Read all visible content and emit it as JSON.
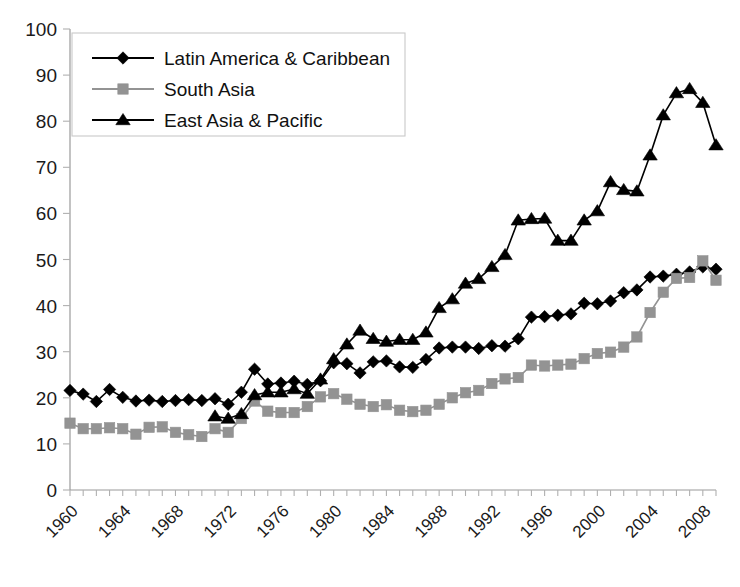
{
  "chart_data": {
    "type": "line",
    "title": "",
    "subtitle": "",
    "xlabel": "",
    "ylabel": "",
    "ylim": [
      0,
      100
    ],
    "ytick_step": 10,
    "yticks": [
      0,
      10,
      20,
      30,
      40,
      50,
      60,
      70,
      80,
      90,
      100
    ],
    "xlim": [
      1960,
      2009
    ],
    "xtick_labels": [
      "1960",
      "1964",
      "1968",
      "1972",
      "1976",
      "1980",
      "1984",
      "1988",
      "1992",
      "1996",
      "2000",
      "2004",
      "2008"
    ],
    "xtick_years": [
      1960,
      1964,
      1968,
      1972,
      1976,
      1980,
      1984,
      1988,
      1992,
      1996,
      2000,
      2004,
      2008
    ],
    "x_minor_tick_interval": 1,
    "grid": false,
    "legend_position": "top-left",
    "x": [
      1960,
      1961,
      1962,
      1963,
      1964,
      1965,
      1966,
      1967,
      1968,
      1969,
      1970,
      1971,
      1972,
      1973,
      1974,
      1975,
      1976,
      1977,
      1978,
      1979,
      1980,
      1981,
      1982,
      1983,
      1984,
      1985,
      1986,
      1987,
      1988,
      1989,
      1990,
      1991,
      1992,
      1993,
      1994,
      1995,
      1996,
      1997,
      1998,
      1999,
      2000,
      2001,
      2002,
      2003,
      2004,
      2005,
      2006,
      2007,
      2008,
      2009
    ],
    "series": [
      {
        "name": "Latin America & Caribbean",
        "color": "#000000",
        "marker": "diamond",
        "x": [
          1960,
          1961,
          1962,
          1963,
          1964,
          1965,
          1966,
          1967,
          1968,
          1969,
          1970,
          1971,
          1972,
          1973,
          1974,
          1975,
          1976,
          1977,
          1978,
          1979,
          1980,
          1981,
          1982,
          1983,
          1984,
          1985,
          1986,
          1987,
          1988,
          1989,
          1990,
          1991,
          1992,
          1993,
          1994,
          1995,
          1996,
          1997,
          1998,
          1999,
          2000,
          2001,
          2002,
          2003,
          2004,
          2005,
          2006,
          2007,
          2008,
          2009
        ],
        "values": [
          21.6,
          20.8,
          19.2,
          21.8,
          20.1,
          19.3,
          19.5,
          19.2,
          19.4,
          19.6,
          19.4,
          19.8,
          18.6,
          21.2,
          26.2,
          23.0,
          23.2,
          23.6,
          22.9,
          23.7,
          27.6,
          27.4,
          25.4,
          27.8,
          28.0,
          26.7,
          26.6,
          28.3,
          30.8,
          31.0,
          31.0,
          30.7,
          31.3,
          31.2,
          32.8,
          37.5,
          37.6,
          37.9,
          38.2,
          40.5,
          40.4,
          41.0,
          42.8,
          43.4,
          46.2,
          46.4,
          46.8,
          47.3,
          48.4,
          47.9
        ]
      },
      {
        "name": "South Asia",
        "color": "#939393",
        "marker": "square",
        "x": [
          1960,
          1961,
          1962,
          1963,
          1964,
          1965,
          1966,
          1967,
          1968,
          1969,
          1970,
          1971,
          1972,
          1973,
          1974,
          1975,
          1976,
          1977,
          1978,
          1979,
          1980,
          1981,
          1982,
          1983,
          1984,
          1985,
          1986,
          1987,
          1988,
          1989,
          1990,
          1991,
          1992,
          1993,
          1994,
          1995,
          1996,
          1997,
          1998,
          1999,
          2000,
          2001,
          2002,
          2003,
          2004,
          2005,
          2006,
          2007,
          2008,
          2009
        ],
        "values": [
          14.5,
          13.3,
          13.3,
          13.5,
          13.3,
          12.1,
          13.6,
          13.7,
          12.5,
          12.0,
          11.6,
          13.3,
          12.5,
          15.5,
          19.3,
          17.1,
          16.8,
          16.8,
          18.1,
          20.2,
          20.9,
          19.7,
          18.6,
          18.1,
          18.5,
          17.3,
          17.0,
          17.3,
          18.6,
          20.0,
          21.1,
          21.6,
          23.1,
          24.1,
          24.4,
          27.1,
          26.9,
          27.1,
          27.3,
          28.5,
          29.6,
          29.9,
          31.0,
          33.2,
          38.5,
          42.9,
          45.9,
          46.1,
          49.7,
          45.5
        ]
      },
      {
        "name": "East Asia & Pacific",
        "color": "#000000",
        "marker": "triangle",
        "x": [
          1971,
          1972,
          1973,
          1974,
          1975,
          1976,
          1977,
          1978,
          1979,
          1980,
          1981,
          1982,
          1983,
          1984,
          1985,
          1986,
          1987,
          1988,
          1989,
          1990,
          1991,
          1992,
          1993,
          1994,
          1995,
          1996,
          1997,
          1998,
          1999,
          2000,
          2001,
          2002,
          2003,
          2004,
          2005,
          2006,
          2007,
          2008,
          2009
        ],
        "values": [
          16.0,
          15.5,
          16.5,
          20.6,
          21.2,
          21.2,
          21.9,
          20.9,
          24.0,
          28.4,
          31.6,
          34.6,
          32.8,
          32.2,
          32.6,
          32.6,
          34.2,
          39.5,
          41.4,
          44.8,
          45.8,
          48.4,
          51.0,
          58.5,
          58.8,
          58.9,
          54.1,
          54.1,
          58.5,
          60.5,
          66.8,
          65.1,
          64.8,
          72.6,
          81.3,
          86.1,
          87.0,
          84.0,
          74.8
        ]
      }
    ]
  },
  "legend": {
    "entries": [
      {
        "label": "Latin America & Caribbean",
        "marker": "diamond",
        "color": "#000000"
      },
      {
        "label": "South Asia",
        "marker": "square",
        "color": "#939393"
      },
      {
        "label": "East Asia & Pacific",
        "marker": "triangle",
        "color": "#000000"
      }
    ]
  },
  "colors": {
    "latin_america": "#000000",
    "south_asia": "#939393",
    "east_asia": "#000000",
    "axis": "#9a9a9a",
    "background": "#ffffff"
  }
}
